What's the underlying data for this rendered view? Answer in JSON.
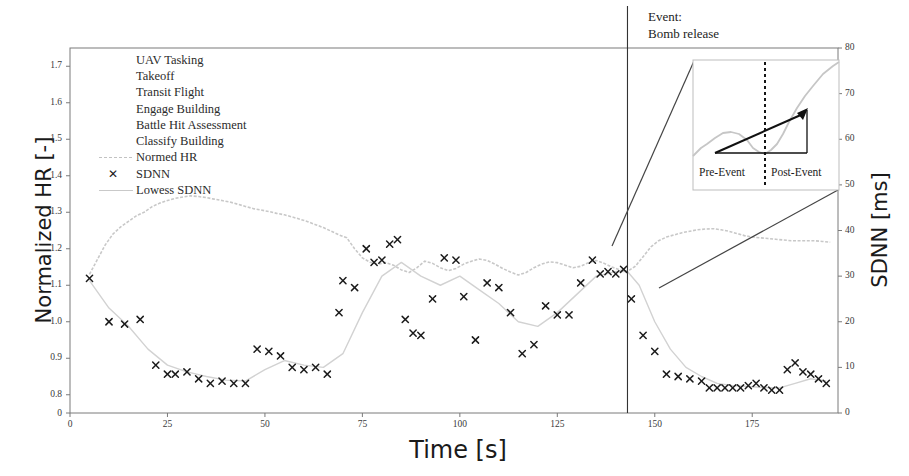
{
  "chart_data": {
    "type": "line",
    "title": "",
    "xlabel": "Time [s]",
    "ylabel": "Normalized HR [-]",
    "y2label": "SDNN [ms]",
    "xlim": [
      0,
      197
    ],
    "ylim": [
      0.75,
      1.75
    ],
    "y2lim": [
      0,
      80
    ],
    "xticks": [
      0,
      25,
      50,
      75,
      100,
      125,
      150,
      175
    ],
    "yticks": [
      0.8,
      0.9,
      1.0,
      1.1,
      1.2,
      1.3,
      1.4,
      1.5,
      1.6,
      1.7
    ],
    "y2ticks": [
      0,
      10,
      20,
      30,
      40,
      50,
      60,
      70,
      80
    ],
    "grid": false,
    "legend_position": "upper-left",
    "series": [
      {
        "name": "Normed HR",
        "style": "line",
        "color": "#c8c8c8",
        "axis": "left",
        "x": [
          5,
          7,
          9,
          11,
          13,
          15,
          17,
          19,
          21,
          23,
          25,
          27,
          29,
          31,
          33,
          35,
          37,
          39,
          41,
          43,
          45,
          47,
          49,
          51,
          53,
          55,
          57,
          59,
          61,
          63,
          65,
          67,
          69,
          71,
          73,
          75,
          77,
          79,
          81,
          83,
          85,
          87,
          89,
          91,
          93,
          95,
          97,
          99,
          101,
          103,
          105,
          107,
          109,
          111,
          113,
          115,
          117,
          119,
          121,
          123,
          125,
          127,
          129,
          131,
          133,
          135,
          137,
          139,
          141,
          143,
          145,
          147,
          149,
          151,
          153,
          155,
          157,
          159,
          161,
          163,
          165,
          167,
          169,
          171,
          173,
          175,
          177,
          179,
          181,
          183,
          185,
          187,
          189,
          191,
          193,
          195
        ],
        "y": [
          1.13,
          1.17,
          1.21,
          1.24,
          1.26,
          1.275,
          1.29,
          1.3,
          1.315,
          1.325,
          1.332,
          1.338,
          1.342,
          1.345,
          1.343,
          1.34,
          1.336,
          1.332,
          1.328,
          1.322,
          1.316,
          1.31,
          1.306,
          1.302,
          1.297,
          1.293,
          1.287,
          1.281,
          1.274,
          1.266,
          1.258,
          1.248,
          1.238,
          1.23,
          1.2,
          1.175,
          1.163,
          1.158,
          1.162,
          1.155,
          1.142,
          1.135,
          1.148,
          1.166,
          1.16,
          1.148,
          1.14,
          1.146,
          1.158,
          1.166,
          1.172,
          1.168,
          1.158,
          1.146,
          1.136,
          1.128,
          1.135,
          1.148,
          1.158,
          1.164,
          1.162,
          1.155,
          1.148,
          1.152,
          1.162,
          1.168,
          1.16,
          1.15,
          1.142,
          1.138,
          1.152,
          1.178,
          1.205,
          1.222,
          1.232,
          1.238,
          1.244,
          1.248,
          1.252,
          1.254,
          1.255,
          1.252,
          1.248,
          1.242,
          1.236,
          1.232,
          1.23,
          1.228,
          1.226,
          1.224,
          1.222,
          1.222,
          1.222,
          1.222,
          1.22,
          1.218
        ]
      },
      {
        "name": "SDNN",
        "style": "scatter",
        "marker": "x",
        "color": "#1b1b1b",
        "axis": "right",
        "x": [
          5,
          10,
          14,
          18,
          22,
          25,
          27,
          30,
          33,
          36,
          39,
          42,
          45,
          48,
          51,
          54,
          57,
          60,
          63,
          66,
          69,
          70,
          73,
          76,
          78,
          80,
          82,
          84,
          86,
          88,
          90,
          93,
          96,
          99,
          101,
          104,
          107,
          110,
          113,
          116,
          119,
          122,
          125,
          128,
          131,
          134,
          136,
          138,
          140,
          142,
          144,
          147,
          150,
          153,
          156,
          159,
          162,
          164,
          166,
          168,
          170,
          172,
          174,
          176,
          178,
          180,
          182,
          184,
          186,
          188,
          190,
          192,
          194
        ],
        "y": [
          29.5,
          20.0,
          19.5,
          20.5,
          10.5,
          8.5,
          8.5,
          9.0,
          7.5,
          6.5,
          7.0,
          6.5,
          6.5,
          14.0,
          13.5,
          12.5,
          10.0,
          9.5,
          10.0,
          8.5,
          22.0,
          29.0,
          27.5,
          36.0,
          33.0,
          33.5,
          37.0,
          38.0,
          20.5,
          17.5,
          17.0,
          25.0,
          34.0,
          33.5,
          25.5,
          16.0,
          28.5,
          27.5,
          22.0,
          13.0,
          15.0,
          23.5,
          21.5,
          21.5,
          28.5,
          33.5,
          30.5,
          31.0,
          30.5,
          31.5,
          25.0,
          17.0,
          13.5,
          8.5,
          8.0,
          7.5,
          7.0,
          5.5,
          5.5,
          5.5,
          5.5,
          5.5,
          6.0,
          6.5,
          5.5,
          5.0,
          5.0,
          9.5,
          11.0,
          9.0,
          8.5,
          7.5,
          6.5
        ]
      },
      {
        "name": "Lowess SDNN",
        "style": "line",
        "color": "#d2d2d2",
        "axis": "right",
        "x": [
          5,
          10,
          15,
          20,
          25,
          30,
          35,
          40,
          45,
          50,
          55,
          60,
          65,
          70,
          75,
          80,
          85,
          90,
          95,
          100,
          105,
          110,
          115,
          120,
          125,
          130,
          135,
          140,
          143,
          146,
          150,
          154,
          158,
          162,
          166,
          170,
          174,
          178,
          182,
          186,
          190,
          194
        ],
        "y": [
          29.0,
          23.0,
          19.0,
          14.0,
          10.5,
          9.0,
          8.0,
          7.2,
          7.0,
          9.5,
          11.5,
          10.5,
          10.0,
          13.0,
          22.0,
          30.0,
          33.0,
          30.0,
          28.0,
          30.0,
          27.0,
          24.0,
          20.0,
          19.0,
          22.0,
          26.0,
          30.0,
          31.0,
          31.0,
          28.0,
          20.0,
          14.0,
          10.0,
          8.0,
          6.5,
          6.0,
          5.8,
          5.6,
          5.5,
          6.5,
          7.5,
          7.0
        ]
      }
    ],
    "annotations": {
      "event_line_x": 143,
      "event_label": "Event:\nBomb release",
      "event_label_line1": "Event:",
      "event_label_line2": "Bomb release",
      "inset": {
        "pre_label": "Pre-Event",
        "post_label": "Post-Event",
        "divider_style": "dotted",
        "slope_arrow": true,
        "y_range_shown": [
          50,
          80
        ]
      }
    }
  },
  "axes": {
    "left": {
      "label": "Normalized HR [-]",
      "ticks": [
        "1.7",
        "1.6",
        "1.5",
        "1.4",
        "1.3",
        "1.2",
        "1.1",
        "1.0",
        "0.9",
        "0.8"
      ],
      "origin_tick": "0"
    },
    "right": {
      "label": "SDNN [ms]",
      "ticks": [
        "80",
        "70",
        "60",
        "50",
        "40",
        "30",
        "20",
        "10",
        "0"
      ]
    },
    "bottom": {
      "label": "Time [s]",
      "ticks": [
        "0",
        "25",
        "50",
        "75",
        "100",
        "125",
        "150",
        "175"
      ]
    }
  },
  "legend": {
    "items": [
      {
        "label": "UAV Tasking",
        "key": "none"
      },
      {
        "label": "Takeoff",
        "key": "none"
      },
      {
        "label": "Transit Flight",
        "key": "none"
      },
      {
        "label": "Engage Building",
        "key": "none"
      },
      {
        "label": "Battle Hit Assessment",
        "key": "none"
      },
      {
        "label": "Classify Building",
        "key": "none"
      },
      {
        "label": "Normed HR",
        "key": "dashed-line"
      },
      {
        "label": "SDNN",
        "key": "cross-marker"
      },
      {
        "label": "Lowess SDNN",
        "key": "solid-line"
      }
    ]
  },
  "event": {
    "line1": "Event:",
    "line2": "Bomb release"
  },
  "inset": {
    "pre_label": "Pre-Event",
    "post_label": "Post-Event"
  },
  "colors": {
    "hr_line": "#c8c8c8",
    "lowess_line": "#d2d2d2",
    "marker": "#1b1b1b",
    "axis": "#7a7a7a",
    "annotation": "#1d1d1d"
  }
}
